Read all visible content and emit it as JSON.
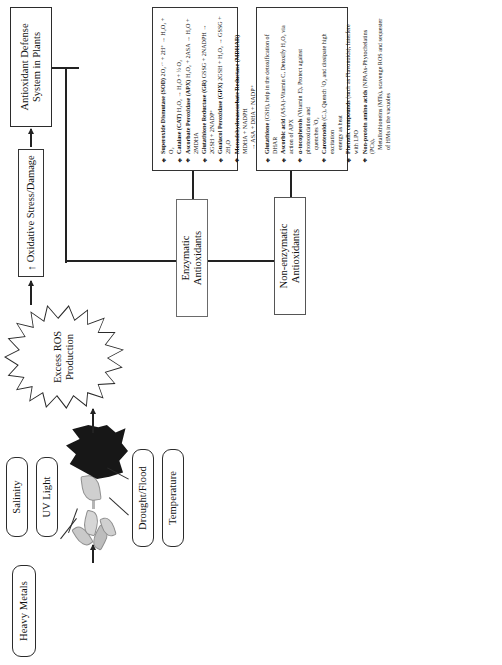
{
  "figure": {
    "orientation": "rotated-90-ccw"
  },
  "stressors": [
    {
      "id": "heavy-metals",
      "label": "Heavy Metals"
    },
    {
      "id": "salinity",
      "label": "Salinity"
    },
    {
      "id": "uv-light",
      "label": "UV Light"
    },
    {
      "id": "drought-flood",
      "label": "Drought/Flood"
    },
    {
      "id": "temperature",
      "label": "Temperature"
    }
  ],
  "artwork": {
    "plant_icon": "stressed-plant-photo",
    "burst_icon": "ros-burst-shape"
  },
  "pipeline": {
    "ros": {
      "line1": "Excess ROS",
      "line2": "Production"
    },
    "oxidative_stress": {
      "arrow": "↑",
      "label": "Oxidative Stress/Damage"
    },
    "defense_system": {
      "label": "Antioxidant Defense System in Plants"
    },
    "enzymatic": {
      "line1": "Enzymatic",
      "line2": "Antioxidants"
    },
    "nonenzymatic": {
      "line1": "Non-enzymatic",
      "line2": "Antioxidants"
    }
  },
  "enzymatic_list": {
    "bullet": "❖",
    "items": [
      {
        "name": "Superoxide Dismutase (SOD)",
        "equation": "2O₂·⁻ + 2H⁺ → H₂O₂ + O₂",
        "continuation": ""
      },
      {
        "name": "Catalase (CAT)",
        "equation": "H₂O₂ → H₂O + ½ O₂",
        "continuation": ""
      },
      {
        "name": "Ascorbate Peroxidase (APX)",
        "equation": "H₂O₂ + 2ASA → H₂O + 2MDHA",
        "continuation": ""
      },
      {
        "name": "Glutathione Reductase (GR)",
        "equation": "GSSG + 2NADPH → 2GSH + 2NADP⁺",
        "continuation": ""
      },
      {
        "name": "Guaiacol Peroxidase (GPX)",
        "equation": "2GSH + H₂O₂ → GSSG + 2H₂O",
        "continuation": ""
      },
      {
        "name": "Monodehydroascorbate Reductase (MDHAR)",
        "equation": "MDHA + NADPH",
        "continuation": "→ ASA + DHA + NADP⁺"
      },
      {
        "name": "Dehydroascorbate Reductase (DHAR)",
        "equation": "DHA + 2GSH → ASA +",
        "continuation": "GSSG"
      }
    ]
  },
  "nonenzymatic_list": {
    "bullet": "❖",
    "items": [
      {
        "name": "Glutathione",
        "detail": "(GSH), help in the detoxification of DHAR",
        "continuation": ""
      },
      {
        "name": "Ascorbic acid",
        "detail": "(ASA)-Vitamin C, Detoxify H₂O₂ via action of APX",
        "continuation": ""
      },
      {
        "name": "α-tocopherols",
        "detail": "(Vitamin E), Protect against photooxidation and",
        "continuation": "quenches ¹O₂"
      },
      {
        "name": "Carotenoids",
        "detail": "(Cₓ), Quench ¹O₂ and dissipate high excitation",
        "continuation": "energy as heat"
      },
      {
        "name": "Phenolic compounds",
        "detail": "(such as Flavonoids), Interfere with LPO",
        "continuation": ""
      },
      {
        "name": "Non-protein amino acids",
        "detail": "(NPAAs-Phytochelatins (PCs),",
        "continuation": "Metallothioneins (MTs), scavenge ROS and sequester of HMs in the vacuoles"
      }
    ]
  },
  "colors": {
    "line": "#222222",
    "box_border": "#2b2b2b",
    "burst_fill": "#171717",
    "background": "#ffffff"
  }
}
